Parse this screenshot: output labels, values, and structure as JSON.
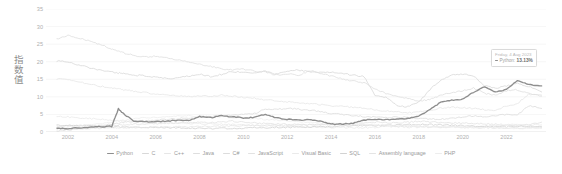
{
  "chart_data": {
    "type": "line",
    "title": "",
    "xlabel": "",
    "ylabel": "指数值",
    "xlim": [
      2001.0,
      2023.8
    ],
    "ylim": [
      0,
      35
    ],
    "grid": true,
    "legend_position": "bottom",
    "xticks": [
      "2002",
      "2004",
      "2006",
      "2008",
      "2010",
      "2012",
      "2014",
      "2016",
      "2018",
      "2020",
      "2022"
    ],
    "xtick_values": [
      2002,
      2004,
      2006,
      2008,
      2010,
      2012,
      2014,
      2016,
      2018,
      2020,
      2022
    ],
    "yticks": [
      "0",
      "5",
      "10",
      "15",
      "20",
      "25",
      "30",
      "35"
    ],
    "ytick_values": [
      0,
      5,
      10,
      15,
      20,
      25,
      30,
      35
    ],
    "x": [
      2001.5,
      2002.0,
      2002.5,
      2003.0,
      2003.5,
      2004.0,
      2004.3,
      2004.6,
      2005.0,
      2005.5,
      2006.0,
      2006.5,
      2007.0,
      2007.5,
      2008.0,
      2008.5,
      2009.0,
      2009.5,
      2010.0,
      2010.5,
      2011.0,
      2011.5,
      2012.0,
      2012.5,
      2013.0,
      2013.5,
      2014.0,
      2014.5,
      2015.0,
      2015.5,
      2016.0,
      2016.5,
      2017.0,
      2017.5,
      2018.0,
      2018.5,
      2019.0,
      2019.5,
      2020.0,
      2020.5,
      2021.0,
      2021.5,
      2022.0,
      2022.5,
      2023.0,
      2023.6
    ],
    "series": [
      {
        "name": "Python",
        "color": "#8e8e8e",
        "emphasis": true,
        "values": [
          1.1,
          1.0,
          1.2,
          1.3,
          1.5,
          1.6,
          6.6,
          4.8,
          3.2,
          2.9,
          3.0,
          3.1,
          3.3,
          3.3,
          4.4,
          4.1,
          4.6,
          4.3,
          4.0,
          4.1,
          5.1,
          4.0,
          3.6,
          3.4,
          3.5,
          3.1,
          2.2,
          2.3,
          2.5,
          3.4,
          3.6,
          3.5,
          3.6,
          3.9,
          4.5,
          6.3,
          8.5,
          9.0,
          9.4,
          11.3,
          12.9,
          11.3,
          12.2,
          14.6,
          13.5,
          13.13
        ]
      },
      {
        "name": "C",
        "color": "#d8d8d8",
        "emphasis": false,
        "values": [
          20.2,
          19.9,
          19.0,
          18.3,
          17.6,
          17.0,
          16.8,
          16.6,
          16.2,
          16.0,
          15.6,
          15.2,
          15.4,
          15.9,
          16.5,
          15.8,
          16.4,
          17.2,
          17.0,
          16.8,
          17.3,
          16.5,
          17.3,
          17.6,
          17.2,
          16.9,
          17.0,
          16.6,
          16.2,
          15.8,
          10.5,
          9.9,
          7.5,
          7.2,
          8.5,
          12.0,
          14.8,
          16.2,
          16.5,
          16.0,
          13.2,
          12.5,
          13.1,
          13.8,
          13.0,
          11.4
        ]
      },
      {
        "name": "C++",
        "color": "#e6e6e6",
        "emphasis": false,
        "values": [
          15.1,
          14.8,
          14.2,
          13.6,
          13.0,
          12.5,
          12.2,
          11.9,
          11.6,
          11.2,
          10.8,
          10.5,
          10.2,
          10.1,
          10.3,
          10.1,
          10.5,
          10.2,
          9.9,
          9.6,
          9.2,
          8.8,
          8.6,
          8.3,
          8.1,
          7.8,
          7.5,
          7.3,
          7.0,
          6.8,
          6.3,
          6.0,
          5.7,
          5.5,
          5.6,
          6.2,
          6.8,
          7.1,
          6.9,
          6.7,
          6.4,
          6.2,
          7.4,
          8.1,
          10.8,
          10.5
        ]
      },
      {
        "name": "Java",
        "color": "#dedede",
        "emphasis": false,
        "values": [
          26.5,
          27.5,
          26.8,
          25.9,
          24.8,
          23.7,
          23.0,
          22.4,
          21.8,
          21.3,
          21.6,
          21.1,
          20.5,
          20.0,
          19.2,
          18.7,
          18.0,
          17.6,
          17.9,
          17.3,
          17.0,
          16.2,
          16.6,
          16.0,
          17.5,
          16.8,
          15.9,
          15.2,
          14.5,
          14.0,
          12.2,
          11.0,
          10.2,
          9.5,
          8.8,
          9.2,
          10.5,
          11.2,
          11.8,
          12.5,
          11.0,
          10.4,
          11.7,
          12.0,
          11.0,
          10.2
        ]
      },
      {
        "name": "C#",
        "color": "#dcdcdc",
        "emphasis": false,
        "values": [
          0.3,
          0.6,
          1.0,
          1.4,
          1.8,
          2.2,
          2.5,
          2.8,
          3.0,
          3.2,
          3.4,
          3.6,
          3.8,
          4.0,
          4.2,
          4.4,
          4.6,
          4.8,
          5.0,
          5.2,
          6.6,
          6.4,
          6.8,
          6.5,
          6.2,
          5.9,
          5.3,
          5.0,
          4.7,
          4.4,
          4.2,
          4.0,
          4.3,
          4.1,
          3.9,
          3.7,
          3.6,
          4.0,
          4.3,
          4.6,
          4.4,
          4.7,
          5.0,
          4.8,
          7.5,
          6.7
        ]
      },
      {
        "name": "JavaScript",
        "color": "#e2e2e2",
        "emphasis": false,
        "values": [
          1.6,
          1.7,
          1.8,
          1.7,
          1.8,
          1.9,
          2.0,
          2.1,
          2.2,
          2.3,
          2.4,
          2.5,
          2.6,
          2.7,
          2.8,
          2.6,
          2.9,
          3.1,
          2.8,
          2.6,
          2.4,
          2.3,
          2.2,
          2.1,
          2.0,
          2.1,
          2.2,
          2.3,
          2.4,
          2.6,
          2.8,
          2.7,
          2.6,
          2.8,
          3.0,
          2.9,
          2.7,
          2.6,
          2.5,
          2.4,
          2.3,
          2.2,
          2.1,
          2.0,
          2.2,
          2.8
        ]
      },
      {
        "name": "Visual Basic",
        "color": "#eaeaea",
        "emphasis": false,
        "values": [
          4.5,
          4.3,
          4.0,
          3.8,
          3.6,
          3.4,
          3.2,
          3.1,
          3.0,
          2.9,
          2.8,
          2.7,
          2.6,
          2.5,
          2.4,
          2.3,
          2.2,
          2.1,
          2.0,
          1.9,
          1.8,
          1.7,
          1.6,
          1.5,
          1.4,
          1.4,
          1.3,
          1.3,
          1.2,
          1.2,
          1.3,
          1.4,
          1.5,
          1.4,
          1.3,
          1.4,
          1.5,
          1.4,
          1.3,
          1.4,
          1.6,
          1.8,
          2.0,
          2.2,
          2.1,
          2.0
        ]
      },
      {
        "name": "SQL",
        "color": "#d2d2d2",
        "emphasis": false,
        "values": [
          2.0,
          1.9,
          1.8,
          1.7,
          1.6,
          1.5,
          1.5,
          1.4,
          1.4,
          1.3,
          1.3,
          1.2,
          1.2,
          1.1,
          1.1,
          1.0,
          1.0,
          1.1,
          1.1,
          1.2,
          1.2,
          1.3,
          1.3,
          1.4,
          1.4,
          1.5,
          1.5,
          1.6,
          1.7,
          1.8,
          1.8,
          1.9,
          2.0,
          2.1,
          2.2,
          2.1,
          2.0,
          1.9,
          1.8,
          1.7,
          1.6,
          1.5,
          1.5,
          1.6,
          1.7,
          1.5
        ]
      },
      {
        "name": "Assembly language",
        "color": "#e4e4e4",
        "emphasis": false,
        "values": [
          0.9,
          0.9,
          1.0,
          1.0,
          1.1,
          1.1,
          1.2,
          1.2,
          1.3,
          1.3,
          1.4,
          1.4,
          1.5,
          1.5,
          1.6,
          1.6,
          1.7,
          1.7,
          1.8,
          1.8,
          1.9,
          1.9,
          2.0,
          2.0,
          2.1,
          2.1,
          2.2,
          2.2,
          2.1,
          2.0,
          1.9,
          1.8,
          1.7,
          1.6,
          1.5,
          1.5,
          1.4,
          1.4,
          1.3,
          1.3,
          1.2,
          1.2,
          1.1,
          1.1,
          1.2,
          1.3
        ]
      },
      {
        "name": "PHP",
        "color": "#ededed",
        "emphasis": false,
        "values": [
          1.2,
          1.4,
          1.7,
          2.0,
          2.4,
          2.8,
          3.1,
          3.4,
          3.7,
          4.0,
          4.2,
          4.4,
          4.5,
          4.6,
          4.5,
          4.4,
          4.3,
          4.2,
          4.0,
          3.8,
          3.6,
          3.4,
          3.2,
          3.0,
          2.8,
          2.6,
          2.5,
          2.4,
          2.3,
          2.2,
          2.1,
          2.0,
          1.9,
          1.8,
          1.7,
          1.6,
          1.5,
          1.4,
          1.3,
          1.3,
          1.2,
          1.2,
          1.1,
          1.1,
          1.0,
          1.0
        ]
      }
    ]
  },
  "tooltip": {
    "date": "Friday, 4 Aug 2023",
    "series_name": "Python:",
    "value": "13.13%",
    "marker_color": "#8e8e8e"
  },
  "colors": {
    "axis_text": "#b0b0b0",
    "grid": "#f2f2f2",
    "axis_line": "#dadada",
    "legend_text": "#9a9a9a",
    "background": "#ffffff"
  }
}
